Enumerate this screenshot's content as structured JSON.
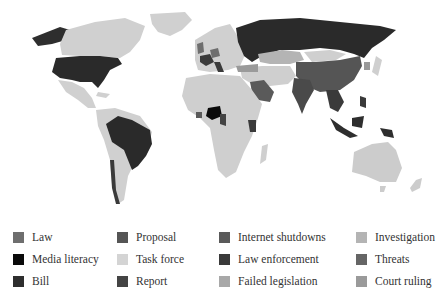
{
  "map": {
    "title": "",
    "colors": {
      "default": "#cfcfcf",
      "ocean": "#ffffff",
      "border": "#ffffff"
    },
    "regions": [
      {
        "name": "Alaska/Canada",
        "category": "Task force"
      },
      {
        "name": "USA",
        "category": "Bill"
      },
      {
        "name": "Greenland",
        "category": "Task force"
      },
      {
        "name": "Mexico",
        "category": "Task force"
      },
      {
        "name": "Brazil",
        "category": "Bill"
      },
      {
        "name": "South America (other)",
        "category": "Task force"
      },
      {
        "name": "Russia",
        "category": "Bill"
      },
      {
        "name": "China",
        "category": "Law enforcement"
      },
      {
        "name": "India",
        "category": "Law enforcement"
      },
      {
        "name": "Nigeria",
        "category": "Media literacy"
      },
      {
        "name": "Saudi Arabia",
        "category": "Proposal"
      },
      {
        "name": "Kenya",
        "category": "Law enforcement"
      },
      {
        "name": "France",
        "category": "Law enforcement"
      },
      {
        "name": "Germany/UK",
        "category": "Law"
      },
      {
        "name": "Indonesia/Malaysia",
        "category": "Bill"
      },
      {
        "name": "Philippines/PNG",
        "category": "Bill"
      },
      {
        "name": "Kazakhstan",
        "category": "Investigation"
      },
      {
        "name": "Mongolia",
        "category": "Task force"
      },
      {
        "name": "Australia",
        "category": "Task force"
      },
      {
        "name": "Africa (other)",
        "category": "Task force"
      }
    ]
  },
  "legend": {
    "items": [
      {
        "label": "Law",
        "color": "#6e6e6e"
      },
      {
        "label": "Media literacy",
        "color": "#0a0a0a"
      },
      {
        "label": "Bill",
        "color": "#2e2e2e"
      },
      {
        "label": "Proposal",
        "color": "#555555"
      },
      {
        "label": "Task force",
        "color": "#d4d4d4"
      },
      {
        "label": "Report",
        "color": "#444444"
      },
      {
        "label": "Internet shutdowns",
        "color": "#5a5a5a"
      },
      {
        "label": "Law enforcement",
        "color": "#3a3a3a"
      },
      {
        "label": "Failed legislation",
        "color": "#a8a8a8"
      },
      {
        "label": "Investigation",
        "color": "#b4b4b4"
      },
      {
        "label": "Threats",
        "color": "#656565"
      },
      {
        "label": "Court ruling",
        "color": "#9a9a9a"
      }
    ]
  }
}
